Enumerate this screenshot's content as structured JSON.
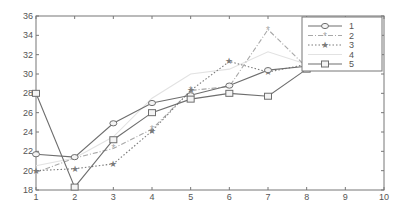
{
  "chart_data": {
    "type": "line",
    "title": "",
    "xlabel": "",
    "ylabel": "",
    "xlim": [
      1,
      10
    ],
    "ylim": [
      18,
      36
    ],
    "x_ticks": [
      1,
      2,
      3,
      4,
      5,
      6,
      7,
      8,
      9,
      10
    ],
    "y_ticks": [
      18,
      20,
      22,
      24,
      26,
      28,
      30,
      32,
      34,
      36
    ],
    "grid": false,
    "legend_position": "upper right",
    "x": [
      1,
      2,
      3,
      4,
      5,
      6,
      7,
      8
    ],
    "series": [
      {
        "name": "1",
        "marker": "circle",
        "line": "solid",
        "color": "#6e6e6e",
        "values": [
          21.7,
          21.4,
          24.9,
          27.0,
          27.8,
          28.8,
          30.4,
          30.8
        ]
      },
      {
        "name": "2",
        "marker": "asterisk",
        "line": "dashdot",
        "color": "#a8a8a8",
        "values": [
          19.8,
          21.3,
          22.3,
          24.3,
          28.3,
          28.7,
          34.6,
          30.7
        ]
      },
      {
        "name": "3",
        "marker": "star",
        "line": "dotted",
        "color": "#7a7a7a",
        "values": [
          20.0,
          20.2,
          20.7,
          24.1,
          28.3,
          31.3,
          30.2,
          31.0
        ]
      },
      {
        "name": "4",
        "marker": "none",
        "line": "solid",
        "color": "#e2e2e2",
        "values": [
          20.5,
          21.3,
          23.5,
          27.5,
          30.0,
          30.5,
          32.3,
          31.0
        ]
      },
      {
        "name": "5",
        "marker": "square",
        "line": "solid",
        "color": "#6e6e6e",
        "values": [
          28.0,
          18.3,
          23.2,
          26.0,
          27.4,
          28.0,
          27.7,
          30.5
        ]
      }
    ]
  }
}
